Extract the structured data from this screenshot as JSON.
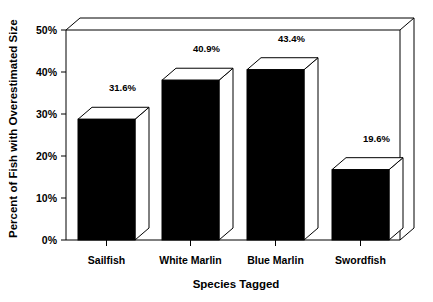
{
  "chart_data": {
    "type": "bar",
    "title": "",
    "xlabel": "Species Tagged",
    "ylabel": "Percent of Fish with Overestimated Size",
    "categories": [
      "Sailfish",
      "White Marlin",
      "Blue Marlin",
      "Swordfish"
    ],
    "values": [
      31.6,
      40.9,
      43.4,
      19.6
    ],
    "value_labels": [
      "31.6%",
      "40.9%",
      "43.4%",
      "19.6%"
    ],
    "ylim": [
      0,
      50
    ],
    "yticks": [
      0,
      10,
      20,
      30,
      40,
      50
    ],
    "ytick_labels": [
      "0%",
      "10%",
      "20%",
      "30%",
      "40%",
      "50%"
    ],
    "grid": false,
    "legend": false,
    "style": "3d-bars",
    "bar_color": "#000000",
    "bar_top_color": "#ffffff",
    "background": "#ffffff"
  }
}
